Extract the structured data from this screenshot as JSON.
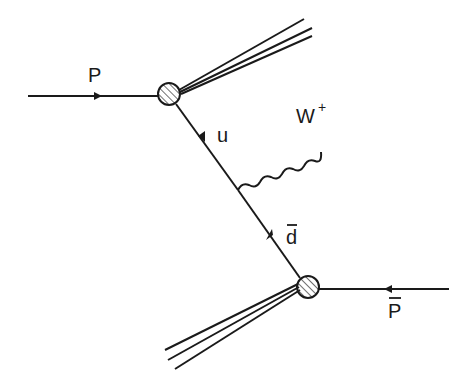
{
  "diagram": {
    "type": "feynman",
    "labels": {
      "proton": "P",
      "antiproton": "P",
      "antiproton_bar": true,
      "quark_u": "u",
      "quark_dbar": "d",
      "quark_dbar_bar": true,
      "boson": "W",
      "boson_charge": "+"
    },
    "nodes": [
      {
        "id": "vertex-top",
        "type": "hadron-blob",
        "x": 169,
        "y": 94
      },
      {
        "id": "vertex-bottom",
        "type": "hadron-blob",
        "x": 308,
        "y": 287
      },
      {
        "id": "w-emission",
        "type": "vertex",
        "x": 238,
        "y": 190
      }
    ],
    "edges": [
      {
        "from": "left",
        "to": "vertex-top",
        "kind": "fermion",
        "label": "P"
      },
      {
        "from": "right",
        "to": "vertex-bottom",
        "kind": "fermion",
        "label": "P-bar"
      },
      {
        "from": "vertex-top",
        "to": "w-emission",
        "kind": "fermion",
        "label": "u"
      },
      {
        "from": "vertex-bottom",
        "to": "w-emission",
        "kind": "fermion",
        "label": "d-bar"
      },
      {
        "from": "w-emission",
        "to": "out",
        "kind": "boson-wavy",
        "label": "W+"
      },
      {
        "from": "vertex-top",
        "to": "upper-right",
        "kind": "spectator-jet"
      },
      {
        "from": "vertex-bottom",
        "to": "lower-left",
        "kind": "spectator-jet"
      }
    ]
  }
}
